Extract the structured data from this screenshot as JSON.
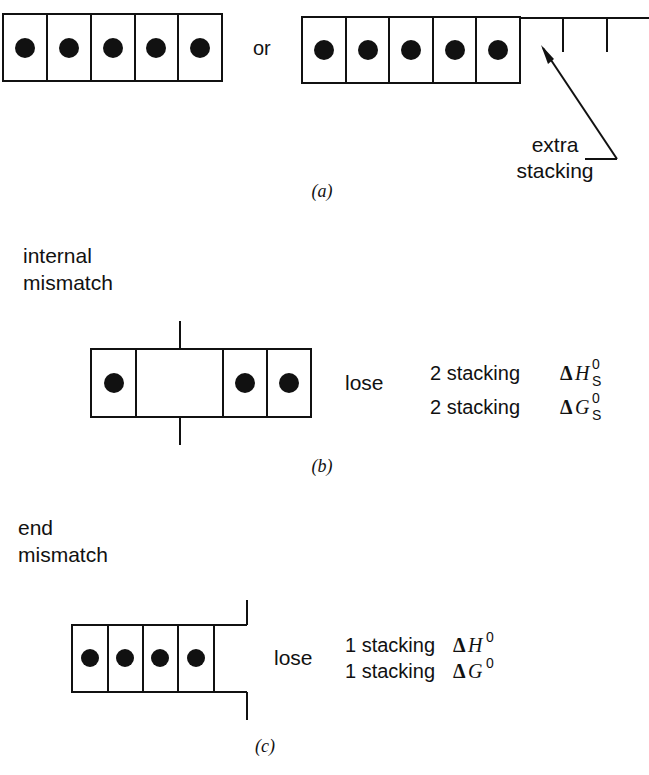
{
  "panels": {
    "a": {
      "label": "(a)",
      "left_strand": {
        "cells": 5,
        "dots": 5
      },
      "connector": "or",
      "right_strand": {
        "cells": 5,
        "dots": 5,
        "overhang_ticks": 2
      },
      "annotation": {
        "line1": "extra",
        "line2": "stacking"
      }
    },
    "b": {
      "label": "(b)",
      "title": {
        "line1": "internal",
        "line2": "mismatch"
      },
      "strand": {
        "cells": [
          "dot",
          "empty-wide",
          "dot",
          "dot"
        ]
      },
      "verb": "lose",
      "losses": [
        {
          "count": "2 stacking",
          "symbol": "ΔH",
          "sup": "0",
          "sub": "S"
        },
        {
          "count": "2 stacking",
          "symbol": "ΔG",
          "sup": "0",
          "sub": "S"
        }
      ]
    },
    "c": {
      "label": "(c)",
      "title": {
        "line1": "end",
        "line2": "mismatch"
      },
      "strand": {
        "cells": 4,
        "dots": 4
      },
      "verb": "lose",
      "losses": [
        {
          "count": "1 stacking",
          "symbol": "ΔH",
          "sup": "0"
        },
        {
          "count": "1 stacking",
          "symbol": "ΔG",
          "sup": "0"
        }
      ]
    }
  },
  "colors": {
    "ink": "#111111",
    "background": "#ffffff"
  }
}
